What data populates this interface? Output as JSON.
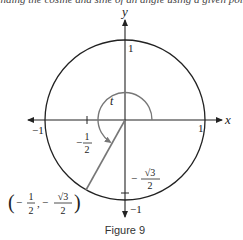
{
  "figure": {
    "caption": "Figure 9",
    "top_cutoff_text": "Finding the cosine and sine of an angle using a given point",
    "axes": {
      "x_label": "x",
      "y_label": "y",
      "x_ticks": {
        "neg_one": "−1",
        "pos_one": "1"
      },
      "y_ticks": {
        "pos_one": "1",
        "neg_one": "−1"
      }
    },
    "angle_label": "t",
    "x_coord_label": {
      "sign": "−",
      "num": "1",
      "den": "2"
    },
    "y_coord_label": {
      "sign": "−",
      "num": "√3",
      "den": "2"
    },
    "point_label": {
      "open": "(",
      "x_sign": "−",
      "x_num": "1",
      "x_den": "2",
      "sep": ",",
      "y_sign": "−",
      "y_num": "√3",
      "y_den": "2",
      "close": ")"
    },
    "colors": {
      "axis": "#222222",
      "circle": "#222222",
      "radius_line": "#777777",
      "angle_arc": "#777777"
    }
  }
}
